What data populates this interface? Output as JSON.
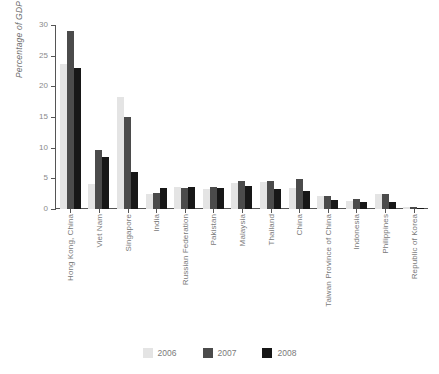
{
  "chart_data": {
    "type": "bar",
    "title": "",
    "xlabel": "",
    "ylabel": "Percentage of GDP",
    "ylim": [
      0,
      30
    ],
    "yticks": [
      0,
      5,
      10,
      15,
      20,
      25,
      30
    ],
    "grid": false,
    "legend_position": "bottom",
    "categories": [
      "Hong Kong, China",
      "Viet Nam",
      "Singapore",
      "India",
      "Russian Federation",
      "Pakistan",
      "Malaysia",
      "Thailand",
      "China",
      "Taiwan Province of China",
      "Indonesia",
      "Philippines",
      "Republic of Korea"
    ],
    "series": [
      {
        "name": "2006",
        "color": "#e4e4e4",
        "values": [
          23.7,
          4.0,
          18.3,
          2.5,
          3.6,
          3.2,
          4.2,
          4.4,
          3.4,
          2.2,
          1.3,
          2.4,
          0.3
        ]
      },
      {
        "name": "2007",
        "color": "#4b4b4b",
        "values": [
          29.0,
          9.6,
          15.0,
          2.6,
          3.5,
          3.6,
          4.5,
          4.5,
          4.9,
          2.2,
          1.7,
          2.5,
          0.4
        ]
      },
      {
        "name": "2008",
        "color": "#171717",
        "values": [
          23.0,
          8.5,
          6.0,
          3.5,
          3.6,
          3.4,
          3.7,
          3.2,
          3.0,
          1.5,
          1.2,
          1.1,
          0.2
        ]
      }
    ]
  }
}
